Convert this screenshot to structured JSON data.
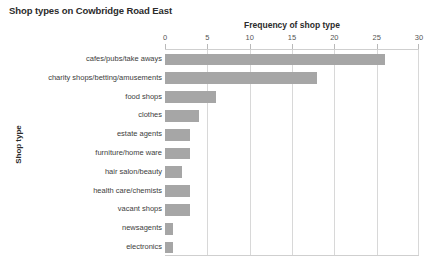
{
  "chart_data": {
    "type": "bar",
    "orientation": "horizontal",
    "title": "Shop types on Cowbridge Road East",
    "xlabel": "Frequency of shop type",
    "ylabel": "Shop type",
    "xlim": [
      0,
      30
    ],
    "xticks": [
      0,
      5,
      10,
      15,
      20,
      25,
      30
    ],
    "xtick_labels": [
      "0",
      "5",
      "10",
      "15",
      "20",
      "25",
      "30"
    ],
    "grid": "vertical",
    "legend": "none",
    "bar_color": "#a6a6a6",
    "categories": [
      "cafes/pubs/take aways",
      "charity shops/betting/amusements",
      "food shops",
      "clothes",
      "estate agents",
      "furniture/home ware",
      "hair salon/beauty",
      "health care/chemists",
      "vacant shops",
      "newsagents",
      "electronics"
    ],
    "values": [
      26,
      18,
      6,
      4,
      3,
      3,
      2,
      3,
      3,
      1,
      1
    ]
  }
}
